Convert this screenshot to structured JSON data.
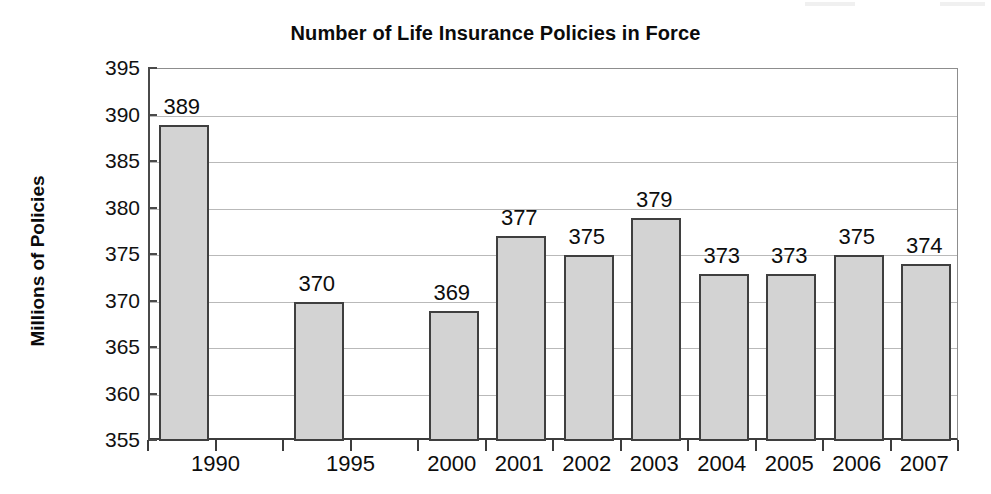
{
  "chart_data": {
    "type": "bar",
    "title": "Number of Life Insurance Policies in Force",
    "xlabel": "",
    "ylabel": "Millions of Policies",
    "categories": [
      "1990",
      "1995",
      "2000",
      "2001",
      "2002",
      "2003",
      "2004",
      "2005",
      "2006",
      "2007"
    ],
    "values": [
      389,
      370,
      369,
      377,
      375,
      379,
      373,
      373,
      375,
      374
    ],
    "value_labels": [
      "389",
      "370",
      "369",
      "377",
      "375",
      "379",
      "373",
      "373",
      "375",
      "374"
    ],
    "ylim": [
      355,
      395
    ],
    "ytick_labels": [
      "395",
      "390",
      "385",
      "380",
      "375",
      "370",
      "365",
      "360",
      "355"
    ],
    "ytick_values": [
      395,
      390,
      385,
      380,
      375,
      370,
      365,
      360,
      355
    ],
    "ytick_step": 5,
    "grid": true,
    "legend": null,
    "legend_position": "none",
    "bar_fill_color": "#d3d3d3",
    "bar_border_color": "#3f3f3f",
    "gridline_color": "#b9b9b9",
    "axis_color": "#3c3c3c",
    "text_color": "#0d0d0d",
    "slot_layout": [
      {
        "category": "1990",
        "slot": 0,
        "span": 2,
        "has_bar": true,
        "value": 389
      },
      {
        "category": "1995",
        "slot": 2,
        "span": 2,
        "has_bar": true,
        "value": 370
      },
      {
        "category": "2000",
        "slot": 4,
        "span": 1,
        "has_bar": true,
        "value": 369
      },
      {
        "category": "2001",
        "slot": 5,
        "span": 1,
        "has_bar": true,
        "value": 377
      },
      {
        "category": "2002",
        "slot": 6,
        "span": 1,
        "has_bar": true,
        "value": 375
      },
      {
        "category": "2003",
        "slot": 7,
        "span": 1,
        "has_bar": true,
        "value": 379
      },
      {
        "category": "2004",
        "slot": 8,
        "span": 1,
        "has_bar": true,
        "value": 373
      },
      {
        "category": "2005",
        "slot": 9,
        "span": 1,
        "has_bar": true,
        "value": 373
      },
      {
        "category": "2006",
        "slot": 10,
        "span": 1,
        "has_bar": true,
        "value": 375
      },
      {
        "category": "2007",
        "slot": 11,
        "span": 1,
        "has_bar": true,
        "value": 374
      }
    ]
  }
}
